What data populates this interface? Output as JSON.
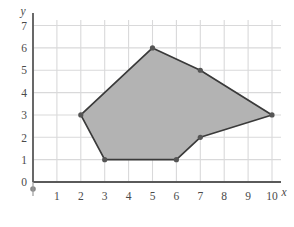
{
  "chart_data": {
    "type": "scatter",
    "title": "",
    "xlabel": "x",
    "ylabel": "y",
    "xlim": [
      0,
      10.5
    ],
    "ylim": [
      0,
      7.5
    ],
    "xticks": [
      "0",
      "1",
      "2",
      "3",
      "4",
      "5",
      "6",
      "7",
      "8",
      "9",
      "10"
    ],
    "yticks": [
      "0",
      "1",
      "2",
      "3",
      "4",
      "5",
      "6",
      "7"
    ],
    "grid": true,
    "legend": "none",
    "series": [
      {
        "name": "polygon",
        "kind": "polygon",
        "closed": true,
        "fill_color": "#b3b3b3",
        "stroke_color": "#3a3a3a",
        "marker": "filled-circle",
        "points": [
          {
            "x": 2,
            "y": 3
          },
          {
            "x": 5,
            "y": 6
          },
          {
            "x": 7,
            "y": 5
          },
          {
            "x": 10,
            "y": 3
          },
          {
            "x": 7,
            "y": 2
          },
          {
            "x": 6,
            "y": 1
          },
          {
            "x": 3,
            "y": 1
          }
        ]
      }
    ],
    "origin_marker": {
      "x": 0,
      "y": 0,
      "style": "filled-dot"
    }
  },
  "axes": {
    "x_label": "x",
    "y_label": "y",
    "x_tick_labels": [
      "0",
      "1",
      "2",
      "3",
      "4",
      "5",
      "6",
      "7",
      "8",
      "9",
      "10"
    ],
    "y_tick_labels": [
      "0",
      "1",
      "2",
      "3",
      "4",
      "5",
      "6",
      "7"
    ],
    "zero_label": "0"
  },
  "colors": {
    "grid": "#d9d9da",
    "axis": "#5a5a5a",
    "polygon_fill": "#b3b3b3",
    "polygon_stroke": "#3a3a3a",
    "vertex": "#555555",
    "text": "#4a4a4a",
    "background": "#ffffff"
  }
}
